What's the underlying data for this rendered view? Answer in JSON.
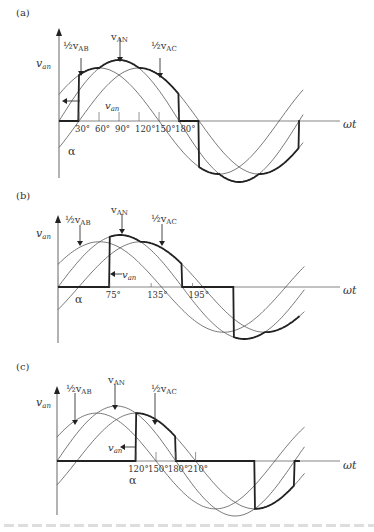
{
  "figure": {
    "panels": [
      {
        "id": "a",
        "label": "(a)",
        "y_axis_label": "v",
        "y_axis_sub": "an",
        "x_axis_label": "ωt",
        "alpha_label": "α",
        "van_label": "v",
        "van_sub": "an",
        "alpha_deg": 30,
        "curve_labels": {
          "vab": {
            "prefix": "½v",
            "sub": "AB"
          },
          "van": {
            "prefix": "v",
            "sub": "AN"
          },
          "vac": {
            "prefix": "½v",
            "sub": "AC"
          }
        },
        "ticks": [
          "30°",
          "60°",
          "90°",
          "120°",
          "150°",
          "180°"
        ],
        "tick_deg": [
          30,
          60,
          90,
          120,
          150,
          180
        ]
      },
      {
        "id": "b",
        "label": "(b)",
        "y_axis_label": "v",
        "y_axis_sub": "an",
        "x_axis_label": "ωt",
        "alpha_label": "α",
        "van_label": "v",
        "van_sub": "an",
        "alpha_deg": 75,
        "curve_labels": {
          "vab": {
            "prefix": "½v",
            "sub": "AB"
          },
          "van": {
            "prefix": "v",
            "sub": "AN"
          },
          "vac": {
            "prefix": "½v",
            "sub": "AC"
          }
        },
        "ticks": [
          "75°",
          "135°",
          "195°"
        ],
        "tick_deg": [
          75,
          135,
          195
        ]
      },
      {
        "id": "c",
        "label": "(c)",
        "y_axis_label": "v",
        "y_axis_sub": "an",
        "x_axis_label": "ωt",
        "alpha_label": "α",
        "van_label": "v",
        "van_sub": "an",
        "alpha_deg": 120,
        "curve_labels": {
          "vab": {
            "prefix": "½v",
            "sub": "AB"
          },
          "van": {
            "prefix": "v",
            "sub": "AN"
          },
          "vac": {
            "prefix": "½v",
            "sub": "AC"
          }
        },
        "ticks": [
          "120°",
          "150°",
          "180°",
          "210°"
        ],
        "tick_deg": [
          120,
          150,
          180,
          210
        ]
      }
    ],
    "colors": {
      "curve": "#555555",
      "output": "#222222",
      "axis": "#666666",
      "text": "#333333"
    }
  }
}
